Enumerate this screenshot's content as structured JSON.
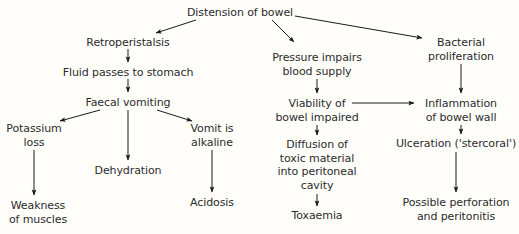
{
  "diagram": {
    "title": "Distension of bowel",
    "type": "flowchart",
    "background_color": "#fffefb",
    "text_color": "#2b2b2b",
    "edge_color": "#1a1a1a",
    "nodes": [
      {
        "id": "distension",
        "label": "Distension of bowel",
        "x": 240,
        "y": 6
      },
      {
        "id": "retroperistalsis",
        "label": "Retroperistalsis",
        "x": 128,
        "y": 36
      },
      {
        "id": "fluid",
        "label": "Fluid passes to stomach",
        "x": 128,
        "y": 66
      },
      {
        "id": "faecal",
        "label": "Faecal vomiting",
        "x": 128,
        "y": 96
      },
      {
        "id": "potassium",
        "label": "Potassium\nloss",
        "x": 34,
        "y": 122
      },
      {
        "id": "dehydration",
        "label": "Dehydration",
        "x": 128,
        "y": 164
      },
      {
        "id": "vomit",
        "label": "Vomit is\nalkaline",
        "x": 212,
        "y": 122
      },
      {
        "id": "weakness",
        "label": "Weakness\nof muscles",
        "x": 38,
        "y": 199
      },
      {
        "id": "acidosis",
        "label": "Acidosis",
        "x": 212,
        "y": 196
      },
      {
        "id": "pressure",
        "label": "Pressure impairs\nblood supply",
        "x": 317,
        "y": 51
      },
      {
        "id": "viability",
        "label": "Viability of\nbowel impaired",
        "x": 317,
        "y": 97
      },
      {
        "id": "diffusion",
        "label": "Diffusion of\ntoxic material\ninto peritoneal\ncavity",
        "x": 317,
        "y": 138
      },
      {
        "id": "toxaemia",
        "label": "Toxaemia",
        "x": 317,
        "y": 209
      },
      {
        "id": "bacterial",
        "label": "Bacterial\nproliferation",
        "x": 461,
        "y": 36
      },
      {
        "id": "inflammation",
        "label": "Inflammation\nof bowel wall",
        "x": 461,
        "y": 97
      },
      {
        "id": "ulceration",
        "label": "Ulceration ('stercoral')",
        "x": 456,
        "y": 137
      },
      {
        "id": "perforation",
        "label": "Possible perforation\nand peritonitis",
        "x": 456,
        "y": 196
      }
    ],
    "edges": [
      {
        "from": "distension",
        "to": "retroperistalsis",
        "x1": 196,
        "y1": 20,
        "x2": 156,
        "y2": 33
      },
      {
        "from": "distension",
        "to": "pressure",
        "x1": 272,
        "y1": 20,
        "x2": 294,
        "y2": 42
      },
      {
        "from": "distension",
        "to": "bacterial",
        "x1": 295,
        "y1": 16,
        "x2": 422,
        "y2": 38
      },
      {
        "from": "retroperistalsis",
        "to": "fluid",
        "x1": 128,
        "y1": 49,
        "x2": 128,
        "y2": 62
      },
      {
        "from": "fluid",
        "to": "faecal",
        "x1": 128,
        "y1": 79,
        "x2": 128,
        "y2": 92
      },
      {
        "from": "faecal",
        "to": "potassium",
        "x1": 100,
        "y1": 110,
        "x2": 60,
        "y2": 121
      },
      {
        "from": "faecal",
        "to": "dehydration",
        "x1": 128,
        "y1": 110,
        "x2": 128,
        "y2": 160
      },
      {
        "from": "faecal",
        "to": "vomit",
        "x1": 157,
        "y1": 110,
        "x2": 192,
        "y2": 121
      },
      {
        "from": "potassium",
        "to": "weakness",
        "x1": 34,
        "y1": 150,
        "x2": 34,
        "y2": 195
      },
      {
        "from": "vomit",
        "to": "acidosis",
        "x1": 212,
        "y1": 150,
        "x2": 212,
        "y2": 192
      },
      {
        "from": "pressure",
        "to": "viability",
        "x1": 317,
        "y1": 79,
        "x2": 317,
        "y2": 93
      },
      {
        "from": "viability",
        "to": "inflammation",
        "x1": 352,
        "y1": 103,
        "x2": 414,
        "y2": 103
      },
      {
        "from": "viability",
        "to": "diffusion",
        "x1": 317,
        "y1": 125,
        "x2": 317,
        "y2": 135
      },
      {
        "from": "diffusion",
        "to": "toxaemia",
        "x1": 317,
        "y1": 194,
        "x2": 317,
        "y2": 206
      },
      {
        "from": "bacterial",
        "to": "inflammation",
        "x1": 461,
        "y1": 64,
        "x2": 461,
        "y2": 93
      },
      {
        "from": "inflammation",
        "to": "ulceration",
        "x1": 461,
        "y1": 125,
        "x2": 461,
        "y2": 134
      },
      {
        "from": "ulceration",
        "to": "perforation",
        "x1": 456,
        "y1": 152,
        "x2": 456,
        "y2": 192
      }
    ]
  }
}
